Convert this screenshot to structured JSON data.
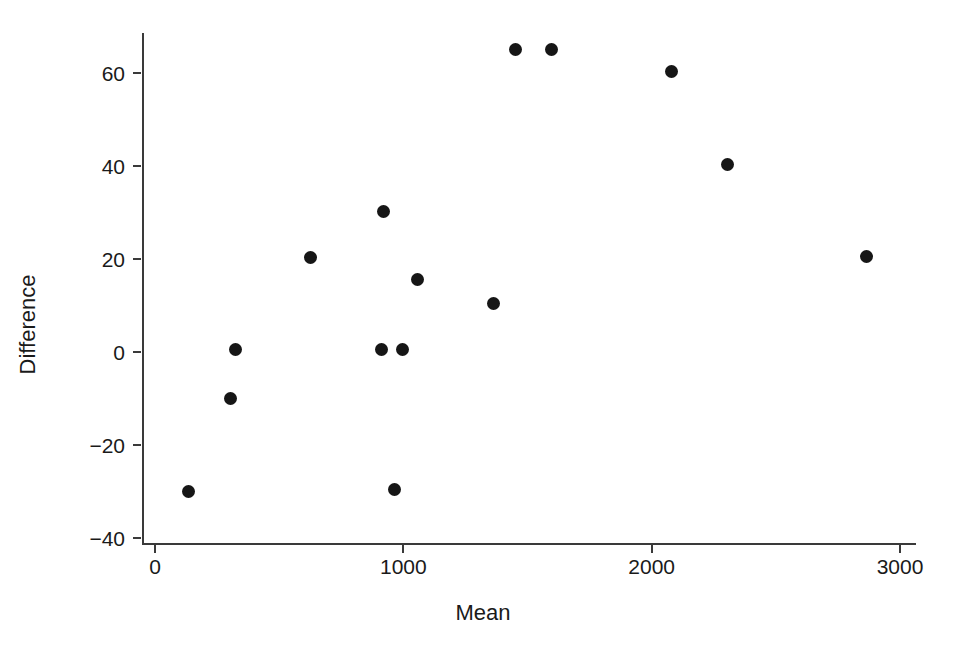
{
  "chart_data": {
    "type": "scatter",
    "title": "",
    "xlabel": "Mean",
    "ylabel": "Difference",
    "xlim": [
      -50,
      3110
    ],
    "ylim": [
      -41,
      70
    ],
    "grid": false,
    "legend": null,
    "xticks": [
      0,
      1000,
      2000,
      3000
    ],
    "xticklabels": [
      "0",
      "1000",
      "2000",
      "3000"
    ],
    "yticks": [
      60,
      40,
      20,
      0,
      -20,
      -40
    ],
    "yticklabels": [
      "60",
      "40",
      "20",
      "0",
      "−20",
      "−40"
    ],
    "marker": "filled-circle",
    "marker_color": "#161616",
    "marker_size": 13,
    "points": [
      {
        "x": 133,
        "y": -30.0
      },
      {
        "x": 306,
        "y": -10.0
      },
      {
        "x": 326,
        "y": 0.5
      },
      {
        "x": 628,
        "y": 20.3
      },
      {
        "x": 914,
        "y": 0.5
      },
      {
        "x": 966,
        "y": -29.5
      },
      {
        "x": 995,
        "y": 0.5
      },
      {
        "x": 920,
        "y": 30.3
      },
      {
        "x": 1059,
        "y": 15.5
      },
      {
        "x": 1365,
        "y": 10.5
      },
      {
        "x": 1450,
        "y": 65.0
      },
      {
        "x": 1595,
        "y": 65.0
      },
      {
        "x": 2078,
        "y": 60.3
      },
      {
        "x": 2304,
        "y": 40.3
      },
      {
        "x": 2864,
        "y": 20.5
      }
    ]
  },
  "axes": {
    "x_title": "Mean",
    "y_title": "Difference"
  }
}
